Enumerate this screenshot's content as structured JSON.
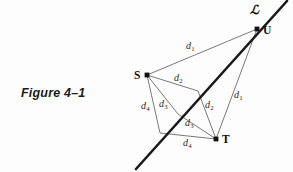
{
  "figure": {
    "caption": "Figure 4–1",
    "background_color": "#fdfdfd",
    "thin_stroke_color": "#6b6b6b",
    "thick_stroke_color": "#1a1a1a",
    "point_color": "#111111"
  },
  "points": [
    {
      "id": "S",
      "label": "S",
      "x": 147,
      "y": 75,
      "label_x": 134,
      "label_y": 69
    },
    {
      "id": "U",
      "label": "U",
      "x": 257,
      "y": 29,
      "label_x": 263,
      "label_y": 24
    },
    {
      "id": "T",
      "label": "T",
      "x": 216,
      "y": 139,
      "label_x": 222,
      "label_y": 133
    }
  ],
  "line_label": {
    "text": "ℒ",
    "x": 250,
    "y": 2
  },
  "line_L": {
    "name": "line-L",
    "x1": 287,
    "y1": 1,
    "x2": 136,
    "y2": 169,
    "stroke_width": 2.6
  },
  "vertices_on_line": [
    {
      "id": "v1",
      "x": 257,
      "y": 29
    },
    {
      "id": "v2",
      "x": 198,
      "y": 91
    },
    {
      "id": "v3",
      "x": 178,
      "y": 114
    },
    {
      "id": "v4",
      "x": 160,
      "y": 133
    }
  ],
  "segments": [
    {
      "name": "S-U-d1",
      "x1": 147,
      "y1": 75,
      "x2": 257,
      "y2": 29
    },
    {
      "name": "S-v2-d2",
      "x1": 147,
      "y1": 75,
      "x2": 198,
      "y2": 91
    },
    {
      "name": "S-v3-d3",
      "x1": 147,
      "y1": 75,
      "x2": 178,
      "y2": 114
    },
    {
      "name": "S-v4-d4",
      "x1": 147,
      "y1": 75,
      "x2": 160,
      "y2": 133
    },
    {
      "name": "U-T-d1",
      "x1": 257,
      "y1": 29,
      "x2": 216,
      "y2": 139
    },
    {
      "name": "v2-T-d2",
      "x1": 198,
      "y1": 91,
      "x2": 216,
      "y2": 139
    },
    {
      "name": "v3-T-d3",
      "x1": 178,
      "y1": 114,
      "x2": 216,
      "y2": 139
    },
    {
      "name": "v4-T-d4",
      "x1": 160,
      "y1": 133,
      "x2": 216,
      "y2": 139
    }
  ],
  "segment_labels": [
    {
      "name": "label-d1-upper",
      "base": "d",
      "sub": "1",
      "x": 186,
      "y": 40
    },
    {
      "name": "label-d2-upper",
      "base": "d",
      "sub": "2",
      "x": 174,
      "y": 72
    },
    {
      "name": "label-d4-left",
      "base": "d",
      "sub": "4",
      "x": 141,
      "y": 100
    },
    {
      "name": "label-d3-left",
      "base": "d",
      "sub": "3",
      "x": 159,
      "y": 98
    },
    {
      "name": "label-d2-right",
      "base": "d",
      "sub": "2",
      "x": 205,
      "y": 99
    },
    {
      "name": "label-d1-right",
      "base": "d",
      "sub": "1",
      "x": 234,
      "y": 89
    },
    {
      "name": "label-d3-lower",
      "base": "d",
      "sub": "3",
      "x": 185,
      "y": 117
    },
    {
      "name": "label-d4-lower",
      "base": "d",
      "sub": "4",
      "x": 183,
      "y": 137
    }
  ]
}
